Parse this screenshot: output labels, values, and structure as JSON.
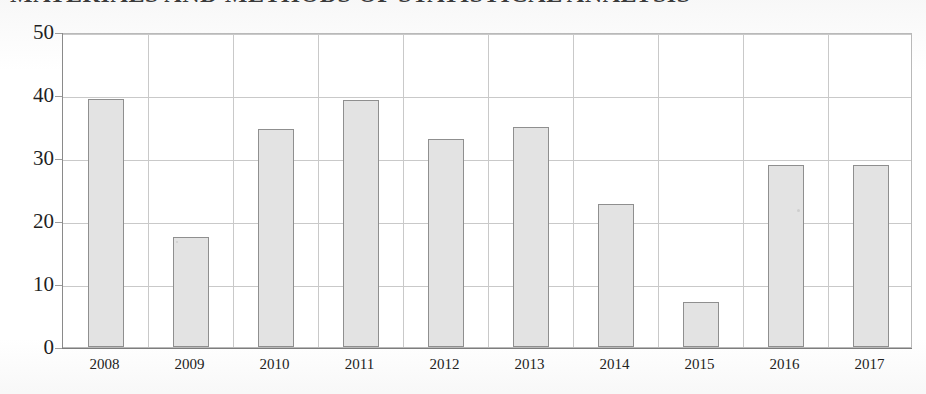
{
  "document": {
    "title_fragment": "MATERIALS AND METHODS OF STATISTICAL ANALYSIS",
    "background_color": "#ffffff"
  },
  "chart_data": {
    "type": "bar",
    "title": "",
    "xlabel": "",
    "ylabel": "",
    "categories": [
      "2008",
      "2009",
      "2010",
      "2011",
      "2012",
      "2013",
      "2014",
      "2015",
      "2016",
      "2017"
    ],
    "values": [
      39.4,
      17.5,
      34.6,
      39.2,
      33.0,
      34.9,
      22.7,
      7.1,
      28.9,
      28.9
    ],
    "ylim": [
      0,
      50
    ],
    "yticks": [
      0,
      10,
      20,
      30,
      40,
      50
    ],
    "ytick_labels": [
      "0",
      "10",
      "20",
      "30",
      "40",
      "50"
    ],
    "grid": true,
    "grid_horizontal": true,
    "grid_vertical": true,
    "legend": false,
    "legend_position": "none",
    "bar_fill_color": "#e3e3e3",
    "bar_edge_color": "#8f8f8f",
    "grid_color": "#c9c9c9",
    "axis_color": "#8a8a8a",
    "bar_width_px": 36,
    "series": [
      {
        "name": "value",
        "values": [
          39.4,
          17.5,
          34.6,
          39.2,
          33.0,
          34.9,
          22.7,
          7.1,
          28.9,
          28.9
        ]
      }
    ]
  }
}
